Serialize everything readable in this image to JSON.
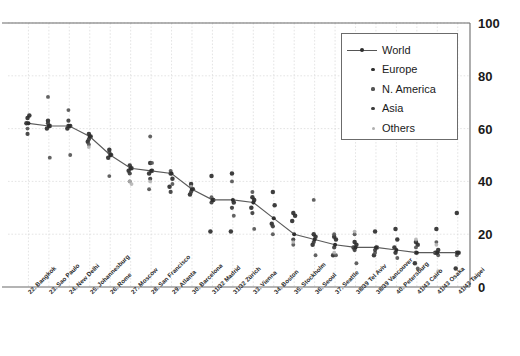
{
  "chart_data": {
    "type": "scatter",
    "title": "",
    "subtitle": "",
    "xlabel": "",
    "ylabel": "",
    "ylim": [
      0,
      100
    ],
    "yticks": [
      0,
      20,
      40,
      60,
      80,
      100
    ],
    "grid": true,
    "legend_position": "top-right",
    "categories": [
      "22. Bangkok",
      "23. Sao Paulo",
      "24. New Delhi",
      "25. Johannesburg",
      "26. Rome",
      "27. Moscow",
      "28. San Francisco",
      "29. Atlanta",
      "30. Barcelona",
      "31/32 Madrid",
      "31/32 Zürich",
      "33. Vienna",
      "34. Boston",
      "35. Stockholm",
      "36. Seoul",
      "37. Seattle",
      "38/39 Tel Aviv",
      "38/39 Vancouver",
      "40. Petersburg",
      "41/43 Cairo",
      "41/43 Osaka",
      "41/43 Taipei"
    ],
    "series": [
      {
        "name": "World",
        "kind": "line",
        "color": "#4a4a4a",
        "values": [
          62,
          61,
          61,
          57,
          50,
          45,
          44,
          43,
          37,
          33,
          33,
          32,
          26,
          20,
          18,
          16,
          15,
          15,
          14,
          13,
          13,
          13
        ]
      },
      {
        "name": "Europe",
        "kind": "points",
        "color": "#2e2e2e",
        "values": [
          [
            64,
            65,
            62
          ],
          [
            63,
            61,
            60
          ],
          [
            61,
            61,
            60
          ],
          [
            58,
            57,
            55
          ],
          [
            52,
            50,
            49
          ],
          [
            46,
            45,
            44
          ],
          [
            47,
            44,
            43
          ],
          [
            43,
            41,
            38
          ],
          [
            39,
            37,
            35
          ],
          [
            42,
            33,
            21
          ],
          [
            43,
            32,
            21
          ],
          [
            34,
            33,
            30
          ],
          [
            36,
            31,
            24
          ],
          [
            28,
            27,
            25
          ],
          [
            20,
            19,
            16
          ],
          [
            19,
            18,
            12
          ],
          [
            17,
            16,
            15
          ],
          [
            21,
            15,
            12
          ],
          [
            22,
            18,
            15
          ],
          [
            17,
            16,
            9
          ],
          [
            22,
            14,
            13
          ],
          [
            28,
            13,
            7
          ]
        ]
      },
      {
        "name": "N. America",
        "kind": "points",
        "color": "#555555",
        "values": [
          [
            60
          ],
          [
            72,
            49
          ],
          [
            67,
            50
          ],
          [
            54
          ],
          [
            42
          ],
          [
            40
          ],
          [
            57,
            47,
            37
          ],
          [
            44,
            39
          ],
          [
            38
          ],
          [
            34
          ],
          [
            40,
            27
          ],
          [
            36,
            22
          ],
          [
            20
          ],
          [
            16
          ],
          [
            33,
            12
          ],
          [
            20,
            12
          ],
          [
            20,
            9
          ],
          [
            13
          ],
          [
            13,
            11
          ],
          [
            15,
            7
          ],
          [
            17,
            12
          ],
          [
            12
          ]
        ]
      },
      {
        "name": "Asia",
        "kind": "points",
        "color": "#3c3c3c",
        "values": [
          [
            58
          ],
          [
            62
          ],
          [
            63
          ],
          [
            56
          ],
          [
            51
          ],
          [
            43
          ],
          [
            41
          ],
          [
            36
          ],
          [
            36
          ],
          [
            32
          ],
          [
            30
          ],
          [
            28
          ],
          [
            23
          ],
          [
            18
          ],
          [
            17
          ],
          [
            15
          ],
          [
            14
          ],
          [
            14
          ],
          [
            13
          ],
          [
            13
          ],
          [
            13
          ],
          [
            13
          ]
        ]
      },
      {
        "name": "Others",
        "kind": "points",
        "color": "#b0b0b0",
        "values": [
          [],
          [],
          [],
          [
            53
          ],
          [],
          [
            40,
            39
          ],
          [
            40
          ],
          [],
          [
            38
          ],
          [],
          [],
          [],
          [],
          [
            17
          ],
          [],
          [
            13
          ],
          [
            21
          ],
          [],
          [],
          [
            18
          ],
          [
            16,
            6
          ],
          []
        ]
      }
    ],
    "legend_entries": [
      {
        "label": "World",
        "marker": "line-dot",
        "color": "#4a4a4a"
      },
      {
        "label": "Europe",
        "marker": "dot",
        "color": "#2e2e2e"
      },
      {
        "label": "N. America",
        "marker": "dot",
        "color": "#555555"
      },
      {
        "label": "Asia",
        "marker": "dot",
        "color": "#3c3c3c"
      },
      {
        "label": "Others",
        "marker": "dot",
        "color": "#b0b0b0"
      }
    ]
  },
  "axis": {
    "y_tick_labels": [
      "100",
      "80",
      "60",
      "40",
      "20",
      "0"
    ]
  },
  "colors": {
    "axis_line": "#6b6b6b",
    "grid_line": "#d8d8d8",
    "world_line": "#5a5a5a",
    "text": "#1a1a1a"
  }
}
